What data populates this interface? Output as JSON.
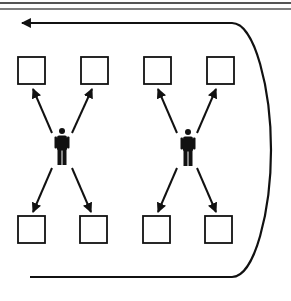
{
  "diagram": {
    "description": "Two persons each pointing to four surrounding boxes, with a loop arrow from bottom back to top-left",
    "colors": {
      "stroke": "#111111",
      "background": "#ffffff",
      "rule": "#555555"
    },
    "header_rules": [
      {
        "y": 3,
        "thickness": 2
      },
      {
        "y": 9,
        "thickness": 1.5
      }
    ],
    "groups": [
      {
        "id": "group-1",
        "person": {
          "icon": "person-icon",
          "cx": 62,
          "top": 128
        },
        "boxes": [
          {
            "position": "top-left",
            "x": 18,
            "y": 57,
            "size": 27
          },
          {
            "position": "top-right",
            "x": 81,
            "y": 57,
            "size": 27
          },
          {
            "position": "bottom-left",
            "x": 18,
            "y": 216,
            "size": 27
          },
          {
            "position": "bottom-right",
            "x": 80,
            "y": 216,
            "size": 27
          }
        ],
        "arrows": [
          {
            "from": [
              52,
              133
            ],
            "to": [
              33,
              89
            ]
          },
          {
            "from": [
              72,
              133
            ],
            "to": [
              92,
              89
            ]
          },
          {
            "from": [
              52,
              168
            ],
            "to": [
              33,
              212
            ]
          },
          {
            "from": [
              72,
              168
            ],
            "to": [
              91,
              212
            ]
          }
        ]
      },
      {
        "id": "group-2",
        "person": {
          "icon": "person-icon",
          "cx": 188,
          "top": 129
        },
        "boxes": [
          {
            "position": "top-left",
            "x": 144,
            "y": 57,
            "size": 27
          },
          {
            "position": "top-right",
            "x": 207,
            "y": 57,
            "size": 27
          },
          {
            "position": "bottom-left",
            "x": 143,
            "y": 216,
            "size": 27
          },
          {
            "position": "bottom-right",
            "x": 205,
            "y": 216,
            "size": 27
          }
        ],
        "arrows": [
          {
            "from": [
              177,
              133
            ],
            "to": [
              158,
              89
            ]
          },
          {
            "from": [
              197,
              133
            ],
            "to": [
              216,
              89
            ]
          },
          {
            "from": [
              177,
              168
            ],
            "to": [
              158,
              212
            ]
          },
          {
            "from": [
              197,
              168
            ],
            "to": [
              216,
              212
            ]
          }
        ]
      }
    ],
    "loop_arrow": {
      "direction": "bottom-to-top-left",
      "top_y": 23,
      "bottom_y": 277,
      "left_end_top": 20,
      "left_end_bottom": 30,
      "right_extent": 271
    }
  }
}
